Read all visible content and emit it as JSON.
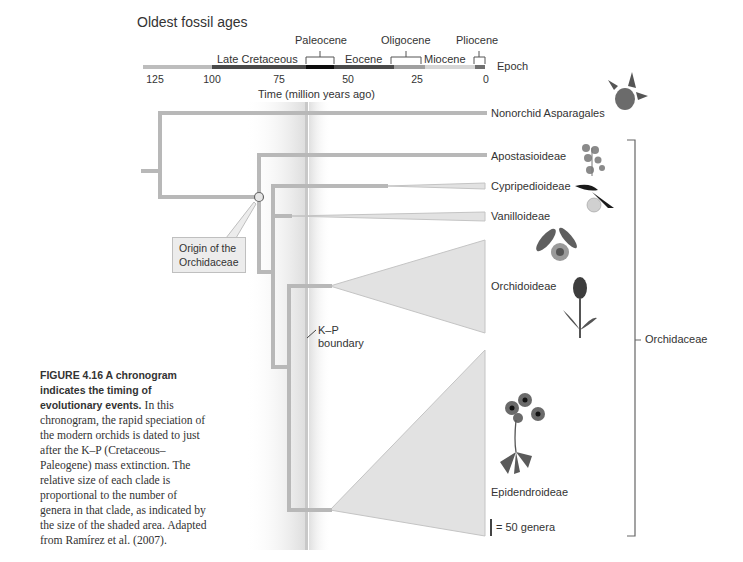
{
  "header": {
    "title": "Oldest fossil ages",
    "epoch_axis_label": "Epoch",
    "axis_title": "Time (million years ago)"
  },
  "epochs": [
    {
      "name": "Late Cretaceous",
      "start": 100,
      "end": 66,
      "color": "#4a4a4a"
    },
    {
      "name": "Paleocene",
      "start": 66,
      "end": 56,
      "color": "#0d0d0d"
    },
    {
      "name": "Eocene",
      "start": 56,
      "end": 34,
      "color": "#4a4a4a"
    },
    {
      "name": "Oligocene",
      "start": 34,
      "end": 23,
      "color": "#a0a0a0"
    },
    {
      "name": "Miocene",
      "start": 23,
      "end": 5,
      "color": "#d6d6d6"
    },
    {
      "name": "Pliocene",
      "start": 5,
      "end": 2,
      "color": "#707070"
    }
  ],
  "axis_ticks": [
    "125",
    "100",
    "75",
    "50",
    "25",
    "0"
  ],
  "clades": [
    {
      "name": "Nonorchid Asparagales"
    },
    {
      "name": "Apostasioideae"
    },
    {
      "name": "Cypripedioideae"
    },
    {
      "name": "Vanilloideae"
    },
    {
      "name": "Orchidoideae"
    },
    {
      "name": "Epidendroideae"
    }
  ],
  "annotations": {
    "origin_line1": "Origin of the",
    "origin_line2": "Orchidaceae",
    "kp_line1": "K–P",
    "kp_line2": "boundary",
    "family_bracket": "Orchidaceae",
    "scale": "= 50 genera"
  },
  "caption": {
    "bold": "FIGURE 4.16 A chronogram indicates the timing of evolutionary events.",
    "body": "In this chronogram, the rapid speciation of the modern orchids is dated to just after the K–P (Cretaceous–Paleogene) mass extinction. The relative size of each clade is proportional to the number of genera in that clade, as indicated by the size of the shaded area. Adapted from Ramírez et al. (2007)."
  },
  "colors": {
    "branch": "#b8b8b8",
    "wedge_fill": "#e2e2e2",
    "kp_line": "#c8c8c8",
    "bracket": "#666666"
  }
}
